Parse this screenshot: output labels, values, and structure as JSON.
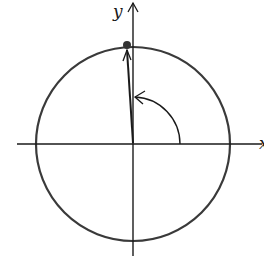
{
  "diagram": {
    "type": "unit-circle-rotation",
    "axes": {
      "x_label": "x",
      "y_label": "y"
    },
    "circle": {
      "cx": 133,
      "cy": 144,
      "r": 97
    },
    "point": {
      "x": 127,
      "y": 45
    },
    "angle_arc": {
      "r": 47,
      "direction": "counterclockwise"
    },
    "colors": {
      "stroke": "#1a1a1a",
      "circle": "#3a3a3a",
      "background": "#ffffff"
    }
  }
}
